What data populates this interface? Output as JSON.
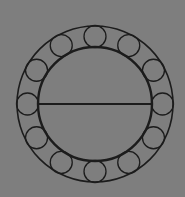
{
  "diagram": {
    "type": "ball-bearing-cross-section",
    "background": "#7e7e7e",
    "stroke": "#1c1c1c",
    "center": [
      95,
      104
    ],
    "outer_ring": {
      "r": 78,
      "stroke_width": 1.6
    },
    "inner_ring": {
      "r": 57,
      "stroke_width": 2.4
    },
    "diameter_line": {
      "y": 104,
      "stroke_width": 2.2
    },
    "balls": {
      "count": 12,
      "orbit_r": 67.5,
      "r": 11,
      "stroke_width": 1.3,
      "start_angle_deg": -90
    }
  }
}
